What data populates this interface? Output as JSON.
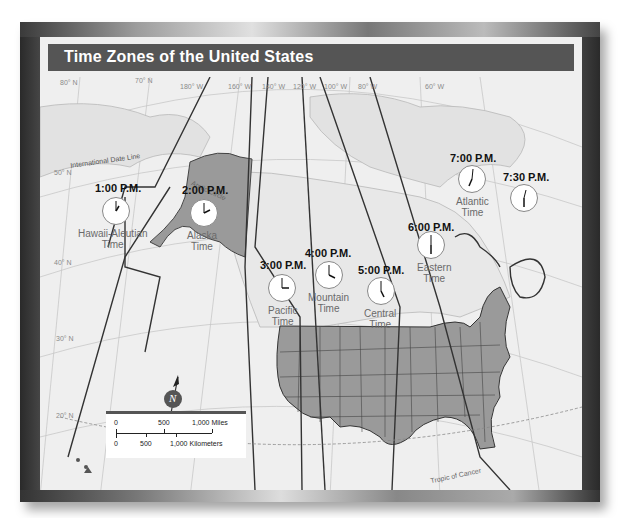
{
  "title": "Time Zones of the United States",
  "latitudes": [
    "80° N",
    "70° N",
    "50° N",
    "40° N",
    "30° N",
    "20° N"
  ],
  "longitudes": [
    "180° W",
    "160° W",
    "140° W",
    "120° W",
    "100° W",
    "80° W",
    "60° W"
  ],
  "line_labels": {
    "date_line": "International Date Line",
    "arctic_circle": "Arctic Circle",
    "tropic_of_cancer": "Tropic of Cancer"
  },
  "zones": [
    {
      "time": "1:00 P.M.",
      "name_line1": "Hawaii-Aleutian",
      "name_line2": "Time",
      "hour": 1,
      "minute": 0
    },
    {
      "time": "2:00 P.M.",
      "name_line1": "Alaska",
      "name_line2": "Time",
      "hour": 2,
      "minute": 0
    },
    {
      "time": "3:00 P.M.",
      "name_line1": "Pacific",
      "name_line2": "Time",
      "hour": 3,
      "minute": 0
    },
    {
      "time": "4:00 P.M.",
      "name_line1": "Mountain",
      "name_line2": "Time",
      "hour": 4,
      "minute": 0
    },
    {
      "time": "5:00 P.M.",
      "name_line1": "Central",
      "name_line2": "Time",
      "hour": 5,
      "minute": 0
    },
    {
      "time": "6:00 P.M.",
      "name_line1": "Eastern",
      "name_line2": "Time",
      "hour": 6,
      "minute": 0
    },
    {
      "time": "7:00 P.M.",
      "name_line1": "Atlantic",
      "name_line2": "Time",
      "hour": 7,
      "minute": 0
    },
    {
      "time": "7:30 P.M.",
      "name_line1": "",
      "name_line2": "",
      "hour": 7,
      "minute": 30
    }
  ],
  "compass": {
    "letter": "N"
  },
  "scale_bar": {
    "miles": [
      "0",
      "500",
      "1,000 Miles"
    ],
    "kilometers": [
      "0",
      "500",
      "1,000 Kilometers"
    ]
  },
  "colors": {
    "title_bar": "#555555",
    "us_fill": "#9a9a9a",
    "alaska_fill": "#9a9a9a",
    "land": "#e4e4e4",
    "water": "#efefef",
    "zone_line": "#333333"
  }
}
